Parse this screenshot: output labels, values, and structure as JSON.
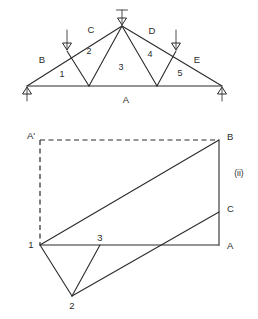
{
  "figure": {
    "title_hidden": "",
    "panels": [
      {
        "id": "truss",
        "caption": ""
      },
      {
        "id": "force-diagram",
        "caption": "(ii)"
      }
    ]
  },
  "truss": {
    "external_space_labels": [
      {
        "name": "A",
        "text": "A",
        "x": 126,
        "y": 100
      },
      {
        "name": "B",
        "text": "B",
        "x": 42,
        "y": 60
      },
      {
        "name": "C",
        "text": "C",
        "x": 91,
        "y": 30
      },
      {
        "name": "D",
        "text": "D",
        "x": 152,
        "y": 31
      },
      {
        "name": "E",
        "text": "E",
        "x": 197,
        "y": 60
      }
    ],
    "internal_space_labels": [
      {
        "name": "1",
        "text": "1",
        "x": 62,
        "y": 75
      },
      {
        "name": "2",
        "text": "2",
        "x": 89,
        "y": 52
      },
      {
        "name": "3",
        "text": "3",
        "x": 121,
        "y": 68
      },
      {
        "name": "4",
        "text": "4",
        "x": 150,
        "y": 55
      },
      {
        "name": "5",
        "text": "5",
        "x": 180,
        "y": 74
      }
    ],
    "loads": [
      {
        "name": "load-left",
        "x": 67,
        "y_top": 30,
        "y_bottom": 47
      },
      {
        "name": "load-apex",
        "x": 122,
        "y_top": 10,
        "y_bottom": 26
      },
      {
        "name": "load-right",
        "x": 176,
        "y_top": 30,
        "y_bottom": 47
      }
    ],
    "reactions": [
      {
        "name": "reaction-left",
        "x": 22,
        "y_top": 86,
        "y_bottom": 101
      },
      {
        "name": "reaction-right",
        "x": 226,
        "y_top": 86,
        "y_bottom": 101
      }
    ]
  },
  "force_diagram": {
    "vertex_labels": [
      {
        "name": "A-prime",
        "text": "A'",
        "x": 31,
        "y": 136
      },
      {
        "name": "B",
        "text": "B",
        "x": 226,
        "y": 137
      },
      {
        "name": "C",
        "text": "C",
        "x": 226,
        "y": 208
      },
      {
        "name": "A",
        "text": "A",
        "x": 226,
        "y": 245
      },
      {
        "name": "1",
        "text": "1",
        "x": 31,
        "y": 245
      },
      {
        "name": "2",
        "text": "2",
        "x": 72,
        "y": 303
      },
      {
        "name": "3",
        "text": "3",
        "x": 100,
        "y": 238
      }
    ],
    "panel_label": "(ii)"
  },
  "colors": {
    "line": "#2b2b2b",
    "background": "#ffffff"
  }
}
